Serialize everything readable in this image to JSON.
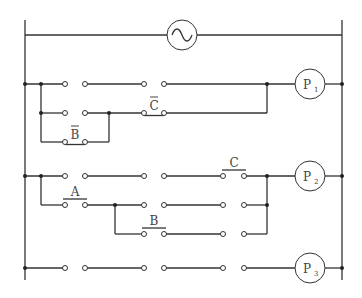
{
  "diagram": {
    "type": "ladder-logic-relay-circuit",
    "source": {
      "symbol": "~",
      "label": "AC source"
    },
    "rungs": [
      {
        "output": {
          "label": "P",
          "subscript": "1"
        },
        "branches": [
          {
            "contacts": [
              {
                "type": "NO",
                "label": ""
              },
              {
                "type": "NO",
                "label": ""
              }
            ]
          },
          {
            "contacts": [
              {
                "type": "NO",
                "label": ""
              },
              {
                "type": "NC",
                "label": "C",
                "negated": true
              }
            ]
          },
          {
            "contacts": [
              {
                "type": "NC",
                "label": "B",
                "negated": true
              }
            ]
          }
        ]
      },
      {
        "output": {
          "label": "P",
          "subscript": "2"
        },
        "branches": [
          {
            "contacts": [
              {
                "type": "NO",
                "label": ""
              },
              {
                "type": "NO",
                "label": ""
              },
              {
                "type": "NO",
                "label": "C"
              }
            ]
          },
          {
            "contacts": [
              {
                "type": "NO",
                "label": "A"
              },
              {
                "type": "NO",
                "label": ""
              },
              {
                "type": "NO",
                "label": ""
              }
            ]
          },
          {
            "contacts": [
              {
                "type": "NO",
                "label": "B"
              },
              {
                "type": "NO",
                "label": ""
              }
            ]
          }
        ]
      },
      {
        "output": {
          "label": "P",
          "subscript": "3"
        },
        "branches": [
          {
            "contacts": [
              {
                "type": "NO",
                "label": ""
              },
              {
                "type": "NO",
                "label": ""
              },
              {
                "type": "NO",
                "label": ""
              }
            ]
          }
        ]
      }
    ],
    "labels": {
      "c_bar": "C",
      "b_bar": "B",
      "a": "A",
      "b": "B",
      "c": "C",
      "p": "P",
      "p1_sub": "1",
      "p2_sub": "2",
      "p3_sub": "3"
    }
  }
}
